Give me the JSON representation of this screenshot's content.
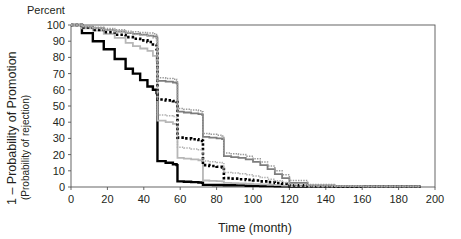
{
  "figure": {
    "corner_label": "Percent",
    "background": "#ffffff"
  },
  "chart_data": {
    "type": "line",
    "title": "",
    "subtitle": "",
    "xlabel": "Time (month)",
    "ylabel": "1 – Probability of Promotion",
    "ylabel_second_line": "(Probability of rejection)",
    "ylabel_top_note": "Percent",
    "xlim": [
      0,
      200
    ],
    "ylim": [
      0,
      100
    ],
    "xticks": [
      0,
      20,
      40,
      60,
      80,
      100,
      120,
      140,
      160,
      180,
      200
    ],
    "xtick_labels": [
      "0",
      "20",
      "40",
      "60",
      "80",
      "100",
      "120",
      "140",
      "160",
      "180",
      "200"
    ],
    "yticks": [
      0,
      10,
      20,
      30,
      40,
      50,
      60,
      70,
      80,
      90,
      100
    ],
    "ytick_labels": [
      "0",
      "10",
      "20",
      "30",
      "40",
      "50",
      "60",
      "70",
      "80",
      "90",
      "100"
    ],
    "grid": false,
    "legend_position": "none",
    "step_type": "post",
    "series": [
      {
        "name": "curve-black-solid",
        "style": "solid",
        "color": "#000000",
        "width": 2.4,
        "x": [
          0,
          6,
          12,
          18,
          24,
          30,
          34,
          38,
          42,
          45,
          47,
          47.5,
          52,
          56,
          58,
          58.5,
          62,
          66,
          70,
          72,
          72.5,
          78,
          84,
          90,
          96,
          104,
          112,
          120,
          130,
          145,
          160,
          175,
          192
        ],
        "y": [
          100,
          95,
          90,
          85,
          79,
          73,
          70,
          66,
          62,
          60,
          58,
          16,
          15,
          14,
          13.5,
          3.5,
          3.2,
          3.0,
          2.8,
          2.6,
          1.3,
          1.2,
          1.1,
          1.0,
          0.8,
          0.6,
          0.4,
          0.3,
          0.2,
          0.2,
          0.2,
          0.2,
          0.2
        ]
      },
      {
        "name": "curve-gray-light-solid",
        "style": "solid",
        "color": "#b7b7b7",
        "width": 1.8,
        "x": [
          0,
          6,
          12,
          18,
          24,
          30,
          34,
          38,
          42,
          45,
          47,
          47.5,
          52,
          56,
          58,
          58.5,
          62,
          66,
          70,
          72,
          72.5,
          76,
          80,
          83,
          84,
          88,
          92,
          96,
          100,
          104,
          108,
          112,
          116,
          120,
          130,
          145,
          160,
          175,
          192
        ],
        "y": [
          100,
          98,
          96.5,
          94.5,
          92,
          89,
          87,
          85.5,
          84,
          81,
          78,
          41,
          40,
          39,
          38.5,
          18,
          17.5,
          17,
          16.5,
          16,
          4.0,
          3.8,
          3.6,
          3.5,
          2.5,
          2.4,
          2.2,
          2.0,
          1.8,
          1.6,
          1.4,
          1.1,
          0.9,
          0.5,
          0.3,
          0.2,
          0.2,
          0.2,
          0.2
        ]
      },
      {
        "name": "curve-black-dotted",
        "style": "dotted",
        "color": "#000000",
        "width": 2.6,
        "x": [
          0,
          6,
          12,
          18,
          24,
          30,
          34,
          38,
          42,
          45,
          47,
          47.5,
          52,
          56,
          58,
          58.5,
          62,
          66,
          70,
          72,
          72.5,
          76,
          80,
          83,
          84,
          88,
          92,
          96,
          100,
          104,
          108,
          112,
          116,
          120,
          130,
          145,
          160,
          175,
          192
        ],
        "y": [
          100,
          98.5,
          97,
          95.5,
          94,
          92.5,
          91.5,
          90.5,
          89.5,
          88,
          85,
          54,
          53.5,
          53,
          52.5,
          30.5,
          30,
          29.5,
          29,
          28.5,
          13.5,
          13,
          12.5,
          12,
          5.5,
          5.2,
          4.8,
          4.4,
          4.0,
          3.5,
          3.0,
          2.5,
          2.0,
          1.0,
          0.5,
          0.3,
          0.2,
          0.2,
          0.2
        ]
      },
      {
        "name": "curve-gray-dark-solid",
        "style": "solid",
        "color": "#7d7d7d",
        "width": 1.8,
        "x": [
          0,
          6,
          12,
          18,
          24,
          30,
          34,
          38,
          42,
          45,
          47,
          47.5,
          52,
          56,
          58,
          58.5,
          62,
          66,
          70,
          72,
          72.5,
          76,
          80,
          83,
          84,
          88,
          92,
          96,
          100,
          104,
          108,
          112,
          116,
          120,
          130,
          145,
          160,
          175,
          192
        ],
        "y": [
          100,
          99,
          98,
          97,
          96,
          95,
          94.5,
          94,
          93.5,
          93,
          92,
          65.5,
          65,
          64.5,
          64,
          46.5,
          46,
          45.5,
          45,
          44.5,
          31,
          30.5,
          30,
          29.5,
          19,
          18.5,
          18,
          17,
          15.5,
          13.5,
          11,
          8,
          5.5,
          2.5,
          1.0,
          0.5,
          0.3,
          0.3,
          0.3
        ]
      },
      {
        "name": "curve-gray-dotted-upper",
        "style": "dotted",
        "color": "#9a9a9a",
        "width": 1.5,
        "x": [
          0,
          6,
          12,
          18,
          24,
          30,
          34,
          38,
          42,
          45,
          47,
          47.5,
          52,
          56,
          58,
          58.5,
          62,
          66,
          70,
          72,
          72.5,
          76,
          80,
          83,
          84,
          88,
          92,
          96,
          100,
          104,
          108,
          112,
          116,
          120,
          130,
          145,
          160,
          175,
          192
        ],
        "y": [
          100,
          99.3,
          98.6,
          97.8,
          97,
          96.2,
          95.8,
          95.4,
          95,
          94.6,
          93.8,
          67.5,
          67,
          66.5,
          66,
          48.5,
          48,
          47.5,
          47,
          46.5,
          33,
          32.5,
          32,
          31.5,
          21,
          20.5,
          20,
          19,
          17.5,
          15.5,
          13,
          10,
          7.5,
          4.0,
          1.6,
          0.8,
          0.5,
          0.5,
          0.5
        ]
      },
      {
        "name": "curve-gray-dotted-lower",
        "style": "dotted",
        "color": "#b0b0b0",
        "width": 1.5,
        "x": [
          0,
          6,
          12,
          18,
          24,
          30,
          34,
          38,
          42,
          45,
          47,
          47.5,
          52,
          56,
          58,
          58.5,
          62,
          66,
          70,
          72,
          72.5,
          76,
          80,
          83,
          84,
          88,
          92,
          96,
          100,
          104,
          108,
          112,
          116,
          120,
          130,
          145,
          160,
          175,
          192
        ],
        "y": [
          100,
          99.0,
          98.0,
          97.0,
          96.0,
          95.0,
          94.2,
          93.6,
          93.0,
          92.2,
          90.5,
          44.5,
          44.0,
          43.5,
          43.0,
          24.5,
          24.0,
          23.5,
          23.0,
          22.5,
          16.0,
          15.6,
          15.2,
          15.0,
          9.0,
          8.6,
          8.2,
          7.6,
          6.8,
          5.8,
          4.8,
          3.8,
          2.8,
          1.4,
          0.6,
          0.4,
          0.3,
          0.3,
          0.3
        ]
      }
    ]
  }
}
